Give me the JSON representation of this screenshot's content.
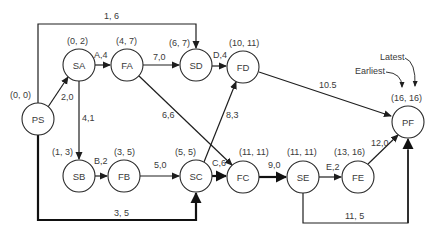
{
  "nodes": {
    "PS": {
      "label": "PS",
      "times": "(0, 0)"
    },
    "SA": {
      "label": "SA",
      "times": "(0, 2)"
    },
    "FA": {
      "label": "FA",
      "times": "(4, 7)"
    },
    "SD": {
      "label": "SD",
      "times": "(6, 7)"
    },
    "FD": {
      "label": "FD",
      "times": "(10, 11)"
    },
    "SB": {
      "label": "SB",
      "times": "(1, 3)"
    },
    "FB": {
      "label": "FB",
      "times": "(3, 5)"
    },
    "SC": {
      "label": "SC",
      "times": "(5, 5)"
    },
    "FC": {
      "label": "FC",
      "times": "(11, 11)"
    },
    "SE": {
      "label": "SE",
      "times": "(11, 11)"
    },
    "FE": {
      "label": "FE",
      "times": "(13, 16)"
    },
    "PF": {
      "label": "PF",
      "times": "(16, 16)"
    }
  },
  "edges": {
    "PS_SD": "1, 6",
    "PS_SA": "2,0",
    "SA_FA": "A,4",
    "SA_SB": "4,1",
    "FA_SD": "7,0",
    "FA_FC": "6,6",
    "SD_FD": "D,4",
    "FD_PF": "10.5",
    "SB_FB": "B,2",
    "FB_SC": "5,0",
    "SC_FD": "8,3",
    "SC_FC": "C,6",
    "PS_SC": "3, 5",
    "FC_SE": "9,0",
    "SE_FE": "E,2",
    "FE_PF": "12,0",
    "SE_PF": "11, 5"
  },
  "legend": {
    "latest": "Latest",
    "earliest": "Earliest"
  }
}
